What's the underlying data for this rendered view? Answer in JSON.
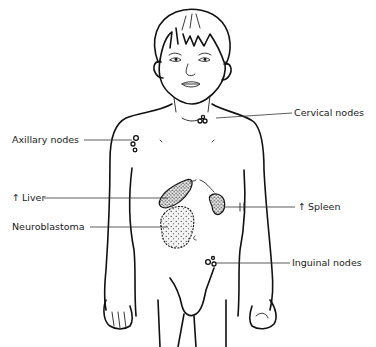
{
  "figure": {
    "labels": {
      "cervical_nodes": "Cervical nodes",
      "axillary_nodes": "Axillary nodes",
      "liver": "Liver",
      "spleen": "Spleen",
      "neuroblastoma": "Neuroblastoma",
      "inguinal_nodes": "Inguinal nodes"
    },
    "arrows": {
      "liver": "↑",
      "spleen": "↑"
    }
  }
}
